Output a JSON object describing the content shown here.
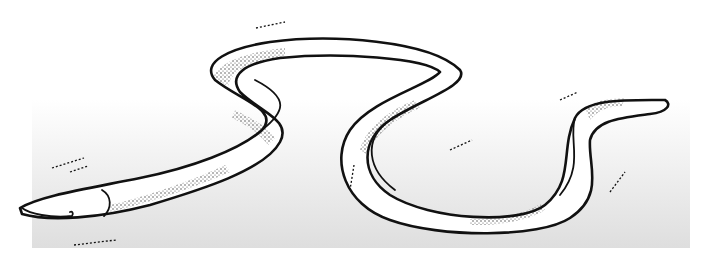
{
  "illustration": {
    "subject": "eel",
    "style": "black ink line drawing with stipple shading",
    "background": {
      "top_color": "#ffffff",
      "bottom_color": "#dedede"
    },
    "ink_color": "#111111",
    "body_fill": "#ffffff"
  }
}
